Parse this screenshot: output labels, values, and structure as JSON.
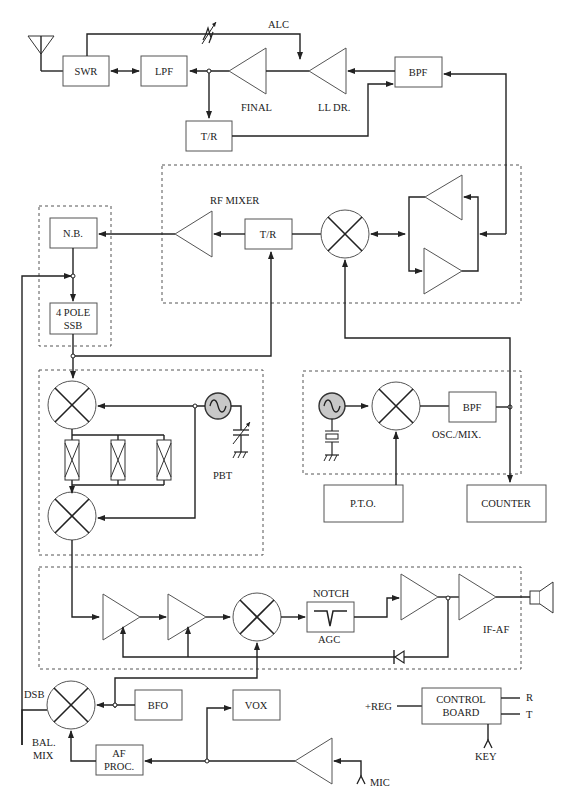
{
  "diagram": {
    "type": "transceiver-block-diagram",
    "transmit_chain": {
      "antenna": "antenna",
      "swr": "SWR",
      "lpf": "LPF",
      "final": "FINAL",
      "ll_dr": "LL DR.",
      "bpf_top": "BPF",
      "tr_top": "T/R",
      "alc": "ALC"
    },
    "rf_mixer": {
      "label": "RF MIXER",
      "tr": "T/R"
    },
    "nb_group": {
      "nb": "N.B.",
      "ssb_line1": "4 POLE",
      "ssb_line2": "SSB"
    },
    "pbt_group": {
      "label": "PBT"
    },
    "osc_group": {
      "bpf": "BPF",
      "label": "OSC./MIX.",
      "pto": "P.T.O.",
      "counter": "COUNTER"
    },
    "if_af_group": {
      "notch": "NOTCH",
      "agc": "AGC",
      "label": "IF-AF"
    },
    "bottom": {
      "dsb": "DSB",
      "bal_line1": "BAL.",
      "bal_line2": "MIX",
      "bfo": "BFO",
      "vox": "VOX",
      "af_line1": "AF",
      "af_line2": "PROC.",
      "mic": "MIC",
      "reg": "+REG",
      "control_line1": "CONTROL",
      "control_line2": "BOARD",
      "r": "R",
      "t": "T",
      "key": "KEY"
    }
  }
}
